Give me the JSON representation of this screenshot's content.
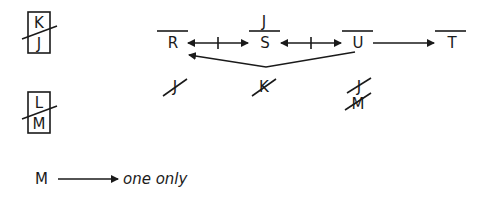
{
  "colors": {
    "ink": "#1a1a1a",
    "background": "#ffffff"
  },
  "rules": {
    "box_1": {
      "top": "K",
      "bottom": "J",
      "meaning": "K or J, not both"
    },
    "box_2": {
      "top": "L",
      "bottom": "M",
      "meaning": "L or M, not both"
    },
    "note": {
      "variable": "M",
      "text": "one only"
    }
  },
  "slots": [
    {
      "id": "R",
      "label": "R",
      "above": "",
      "excluded": [
        "J"
      ]
    },
    {
      "id": "S",
      "label": "S",
      "above": "J",
      "excluded": [
        "K"
      ]
    },
    {
      "id": "U",
      "label": "U",
      "above": "",
      "excluded": [
        "J",
        "M"
      ]
    },
    {
      "id": "T",
      "label": "T",
      "above": "",
      "excluded": []
    }
  ],
  "relations": [
    {
      "from": "R",
      "to": "S",
      "type": "not-equal (double arrow with bar)"
    },
    {
      "from": "S",
      "to": "U",
      "type": "not-equal (double arrow with bar)"
    },
    {
      "from": "U",
      "to": "T",
      "type": "arrow"
    },
    {
      "from": "U",
      "to": "R",
      "type": "arrow via S"
    }
  ]
}
